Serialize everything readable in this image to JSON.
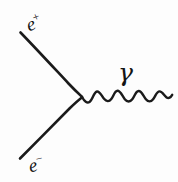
{
  "figure": {
    "kind": "feynman-diagram",
    "background_color": "#fdfdfd",
    "ink_color": "#1a1a1a",
    "width": 178,
    "height": 182
  },
  "labels": {
    "positron": {
      "symbol": "e",
      "charge": "+",
      "full": "e+"
    },
    "electron": {
      "symbol": "e",
      "charge": "−",
      "full": "e−"
    },
    "photon": {
      "symbol": "γ",
      "full": "γ"
    }
  },
  "geometry": {
    "vertex": {
      "x": 82,
      "y": 97
    },
    "positron_line": {
      "x1": 20,
      "y1": 33,
      "x2": 82,
      "y2": 97
    },
    "electron_line": {
      "x1": 20,
      "y1": 158,
      "x2": 82,
      "y2": 97
    },
    "photon_wave": {
      "x1": 84,
      "y1": 97,
      "x2": 172,
      "y2": 95,
      "oscillations": 6,
      "amplitude": 6
    }
  }
}
